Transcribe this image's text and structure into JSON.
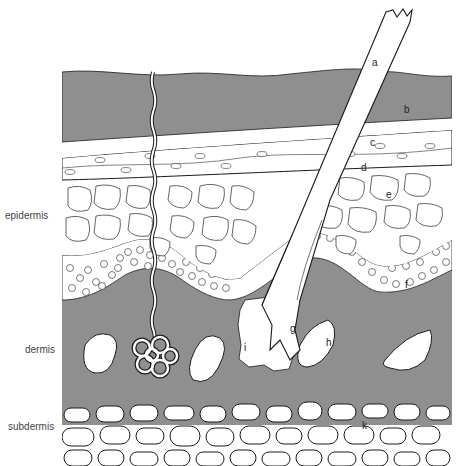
{
  "figure": {
    "colors": {
      "tissue_gray": "#8f8f8f",
      "outline": "#1a1a1a",
      "cell_fill": "#ffffff"
    }
  },
  "layers": [
    {
      "name": "epidermis",
      "label": "epidermis"
    },
    {
      "name": "dermis",
      "label": "dermis"
    },
    {
      "name": "subdermis",
      "label": "subdermis"
    }
  ],
  "parts": [
    {
      "key": "a",
      "label": "a"
    },
    {
      "key": "b",
      "label": "b"
    },
    {
      "key": "c",
      "label": "c"
    },
    {
      "key": "d",
      "label": "d"
    },
    {
      "key": "e",
      "label": "e"
    },
    {
      "key": "f",
      "label": "f"
    },
    {
      "key": "g",
      "label": "g"
    },
    {
      "key": "h",
      "label": "h"
    },
    {
      "key": "i",
      "label": "i"
    },
    {
      "key": "k",
      "label": "k"
    }
  ]
}
